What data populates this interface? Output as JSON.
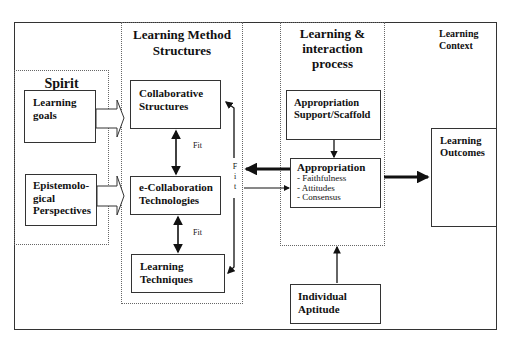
{
  "diagram": {
    "regions": {
      "spirit": {
        "title": "Spirit"
      },
      "method_structures": {
        "title_line1": "Learning Method",
        "title_line2": "Structures"
      },
      "interaction_process": {
        "title_line1": "Learning &",
        "title_line2": "interaction",
        "title_line3": "process"
      },
      "context": {
        "title_line1": "Learning",
        "title_line2": "Context"
      }
    },
    "boxes": {
      "learning_goals": {
        "line1": "Learning",
        "line2": "goals"
      },
      "epistemological": {
        "line1": "Epistemolo-",
        "line2": "gical",
        "line3": "Perspectives"
      },
      "collaborative_structures": {
        "line1": "Collaborative",
        "line2": "Structures"
      },
      "ecollab_tech": {
        "line1": "e-Collaboration",
        "line2": "Technologies"
      },
      "learning_techniques": {
        "line1": "Learning",
        "line2": "Techniques"
      },
      "appropriation_support": {
        "line1": "Appropriation",
        "line2": "Support/Scaffold"
      },
      "appropriation": {
        "title": "Appropriation",
        "items": [
          "- Faithfulness",
          "- Attitudes",
          "- Consensus"
        ]
      },
      "individual_aptitude": {
        "line1": "Individual",
        "line2": "Aptitude"
      },
      "learning_outcomes": {
        "line1": "Learning",
        "line2": "Outcomes"
      }
    },
    "labels": {
      "fit_upper": "Fit",
      "fit_lower": "Fit",
      "fit_vertical": [
        "F",
        "i",
        "t"
      ]
    }
  }
}
